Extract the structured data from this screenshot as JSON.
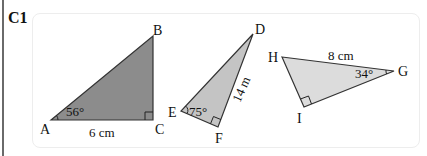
{
  "question": {
    "label": "C1"
  },
  "triangles": [
    {
      "id": "ABC",
      "fill": "#8c8c8c",
      "vertices": {
        "A": "A",
        "B": "B",
        "C": "C"
      },
      "angle_label": "56°",
      "side_label": "6 cm",
      "right_angle_at": "C"
    },
    {
      "id": "DEF",
      "fill": "#c4c4c4",
      "vertices": {
        "D": "D",
        "E": "E",
        "F": "F"
      },
      "angle_label": "75°",
      "side_label": "14 m",
      "right_angle_at": "F"
    },
    {
      "id": "GHI",
      "fill": "#dcdcdc",
      "vertices": {
        "G": "G",
        "H": "H",
        "I": "I"
      },
      "angle_label": "34°",
      "side_label": "8 cm",
      "right_angle_at": "I"
    }
  ]
}
